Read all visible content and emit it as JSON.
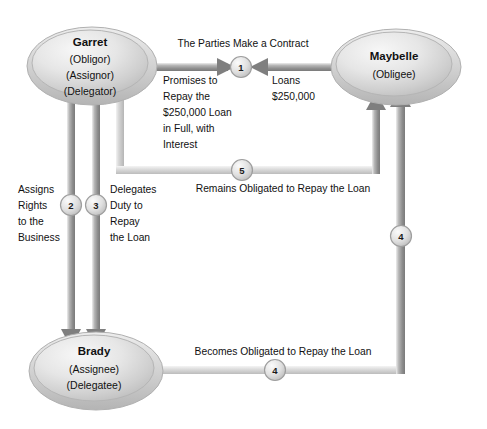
{
  "diagram": {
    "background_color": "#ffffff",
    "palette": {
      "ellipse_fill_light": "#f2f2f2",
      "ellipse_fill_mid": "#c9c9c9",
      "ellipse_stroke": "#a8a8a8",
      "arrow_dark": "#777777",
      "arrow_light": "#bdbdbd",
      "marker_fill": "#d8d8d8",
      "marker_stroke": "#9a9a9a",
      "text_color": "#111111"
    },
    "nodes": [
      {
        "id": "garret",
        "name": "Garret",
        "roles": [
          "(Obligor)",
          "(Assignor)",
          "(Delegator)"
        ],
        "cx": 90,
        "cy": 63,
        "rx": 64,
        "ry": 38
      },
      {
        "id": "maybelle",
        "name": "Maybelle",
        "roles": [
          "(Obligee)"
        ],
        "cx": 394,
        "cy": 64,
        "rx": 64,
        "ry": 36
      },
      {
        "id": "brady",
        "name": "Brady",
        "roles": [
          "(Assignee)",
          "(Delegatee)"
        ],
        "cx": 94,
        "cy": 368,
        "rx": 66,
        "ry": 38
      }
    ],
    "edges": [
      {
        "id": "edge-1-garret-to-maybelle",
        "marker": "1",
        "marker_x": 241,
        "marker_y": 67,
        "heading": "The Parties Make a Contract",
        "heading_x": 243,
        "heading_y": 44,
        "label_lines": [
          "Promises to",
          "Repay the",
          "$250,000 Loan",
          "in Full, with",
          "Interest"
        ],
        "label_x": 163,
        "label_y": 80,
        "direction": "garret-to-marker"
      },
      {
        "id": "edge-1-maybelle-to-garret",
        "marker": "1",
        "label_lines": [
          "Loans",
          "$250,000"
        ],
        "label_x": 272,
        "label_y": 80,
        "direction": "maybelle-to-marker"
      },
      {
        "id": "edge-2-assignment",
        "marker": "2",
        "marker_x": 71,
        "marker_y": 205,
        "label_lines": [
          "Assigns",
          "Rights",
          "to the",
          "Business"
        ],
        "label_x": 18,
        "label_y": 193,
        "direction": "garret-to-brady"
      },
      {
        "id": "edge-3-delegation",
        "marker": "3",
        "marker_x": 96,
        "marker_y": 205,
        "label_lines": [
          "Delegates",
          "Duty to",
          "Repay",
          "the Loan"
        ],
        "label_x": 110,
        "label_y": 193,
        "direction": "garret-to-brady"
      },
      {
        "id": "edge-4-brady-to-maybelle",
        "marker": "4",
        "marker_x": 275,
        "marker_y": 370,
        "marker2": "4",
        "marker2_x": 403,
        "marker2_y": 236,
        "label": "Becomes Obligated to Repay the Loan",
        "label_x": 283,
        "label_y": 352,
        "direction": "brady-to-maybelle"
      },
      {
        "id": "edge-5-garret-remains-obligated",
        "marker": "5",
        "marker_x": 242,
        "marker_y": 170,
        "label": "Becomes Obligated",
        "label_text": "Remains Obligated to Repay the Loan",
        "label_x": 283,
        "label_y": 189,
        "direction": "garret-to-maybelle"
      }
    ]
  }
}
